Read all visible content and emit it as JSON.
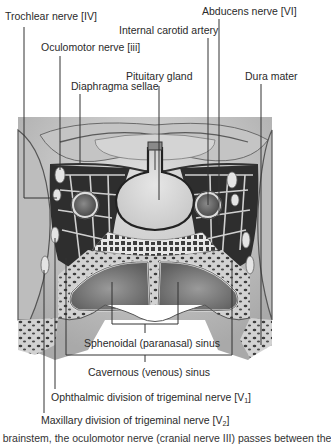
{
  "figure": {
    "type": "anatomical-diagram"
  },
  "labels": {
    "trochlear": "Trochlear nerve [IV]",
    "oculomotor": "Oculomotor nerve [iii]",
    "diaphragma": "Diaphragma sellae",
    "internal_carotid": "Internal carotid artery",
    "pituitary": "Pituitary gland",
    "abducens": "Abducens nerve [VI]",
    "dura": "Dura mater",
    "sphenoidal": "Sphenoidal (paranasal) sinus",
    "cavernous": "Cavernous (venous) sinus",
    "ophthalmic_main": "Ophthalmic division of trigeminal nerve [V",
    "ophthalmic_sub": "1",
    "ophthalmic_end": "]",
    "maxillary_main": "Maxillary division of trigeminal nerve [V",
    "maxillary_sub": "2",
    "maxillary_end": "]"
  },
  "caption": {
    "partial_text": "e brainstem, the oculomotor nerve (cranial nerve III) passes between the"
  },
  "colors": {
    "leader_line": "#333333",
    "tissue_light": "#d6d6d6",
    "tissue_mid": "#a8a8a8",
    "tissue_dark": "#4a4a4a",
    "background": "#ffffff"
  }
}
